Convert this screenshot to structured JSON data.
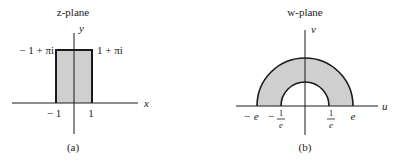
{
  "panels": [
    {
      "id": "a",
      "title": "z-plane",
      "caption": "(a)",
      "axes": {
        "x_label": "x",
        "y_label": "y"
      },
      "corner_labels": {
        "top_left": "− 1 + πi",
        "top_right": "1 + πi"
      },
      "tick_labels": {
        "left": "− 1",
        "right": "1"
      },
      "shape": "rectangle",
      "fill_color": "#cfcfcf"
    },
    {
      "id": "b",
      "title": "w-plane",
      "caption": "(b)",
      "axes": {
        "x_label": "u",
        "y_label": "v"
      },
      "tick_labels": {
        "neg_e": "− e",
        "neg_inv_e_sign": "−",
        "neg_inv_e_num": "1",
        "neg_inv_e_den": "e",
        "inv_e_num": "1",
        "inv_e_den": "e",
        "e": "e"
      },
      "shape": "half-annulus",
      "fill_color": "#cfcfcf"
    }
  ],
  "colors": {
    "stroke": "#1a1a1a",
    "fill": "#cfcfcf",
    "background": "#ffffff"
  }
}
